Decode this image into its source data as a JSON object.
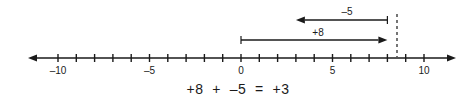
{
  "figure": {
    "type": "number-line-diagram",
    "background_color": "#ffffff",
    "line_color": "#1a1a1a",
    "axis": {
      "min": -11,
      "max": 11,
      "origin_value": 0,
      "pixels_per_unit": 18.3,
      "origin_x": 241,
      "baseline_y": 58,
      "left_arrow_tip_x": 28,
      "right_arrow_tip_x": 456,
      "tick_half_height": 4,
      "tick_values": [
        -10,
        -9,
        -8,
        -7,
        -6,
        -5,
        -4,
        -3,
        -2,
        -1,
        0,
        1,
        2,
        3,
        4,
        5,
        6,
        7,
        8,
        9,
        10
      ],
      "labeled_ticks": [
        {
          "value": -10,
          "label": "–10"
        },
        {
          "value": -5,
          "label": "–5"
        },
        {
          "value": 0,
          "label": "0"
        },
        {
          "value": 5,
          "label": "5"
        },
        {
          "value": 10,
          "label": "10"
        }
      ]
    },
    "jumps": [
      {
        "name": "first-jump",
        "label": "+8",
        "from_value": 0,
        "to_value": 8,
        "direction": "right",
        "arrow_y": 40,
        "label_x": 318,
        "label_y": 36
      },
      {
        "name": "second-jump",
        "label": "–5",
        "from_value": 8,
        "to_value": 3,
        "direction": "left",
        "arrow_y": 20,
        "label_x": 347,
        "label_y": 15
      }
    ],
    "dashed_connector": {
      "value": 8,
      "x": 397,
      "top_y": 14,
      "bottom_y": 57
    }
  },
  "equation": {
    "text": "+8  +  –5  =  +3",
    "first_term": "+8",
    "operator": "+",
    "second_term": "–5",
    "equals": "=",
    "result": "+3"
  }
}
